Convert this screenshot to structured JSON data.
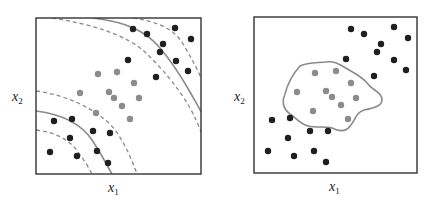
{
  "chart_data": [
    {
      "type": "scatter",
      "title": "",
      "xlabel": "x1",
      "ylabel": "x2",
      "grid": false,
      "legend": null,
      "description": "Two classes separated by a nonlinear (polynomial-like) decision boundary with two solid boundary curves and dashed margin curves",
      "series": [
        {
          "name": "class-dark",
          "color": "#1f1f1f",
          "points": [
            [
              133,
              29
            ],
            [
              147,
              34
            ],
            [
              175,
              28
            ],
            [
              191,
              39
            ],
            [
              163,
              44
            ],
            [
              160,
              52
            ],
            [
              128,
              60
            ],
            [
              176,
              61
            ],
            [
              188,
              71
            ],
            [
              156,
              77
            ],
            [
              54,
              121
            ],
            [
              72,
              119
            ],
            [
              93,
              131
            ],
            [
              110,
              133
            ],
            [
              70,
              138
            ],
            [
              50,
              152
            ],
            [
              77,
              156
            ],
            [
              97,
              151
            ],
            [
              108,
              163
            ]
          ]
        },
        {
          "name": "class-light",
          "color": "#8c8c8c",
          "points": [
            [
              98,
              74
            ],
            [
              117,
              72
            ],
            [
              134,
              83
            ],
            [
              80,
              93
            ],
            [
              109,
              92
            ],
            [
              114,
              98
            ],
            [
              139,
              98
            ],
            [
              122,
              106
            ],
            [
              96,
              113
            ],
            [
              130,
              119
            ]
          ]
        }
      ],
      "boundaries": {
        "solid": 2,
        "dashed": 4
      }
    },
    {
      "type": "scatter",
      "title": "",
      "xlabel": "x1",
      "ylabel": "x2",
      "grid": false,
      "legend": null,
      "description": "Same two classes separated by an irregular closed decision boundary enclosing the light class",
      "series": [
        {
          "name": "class-dark",
          "color": "#1f1f1f",
          "points": [
            [
              351,
              29
            ],
            [
              364,
              34
            ],
            [
              394,
              27
            ],
            [
              408,
              38
            ],
            [
              381,
              44
            ],
            [
              377,
              52
            ],
            [
              394,
              60
            ],
            [
              406,
              70
            ],
            [
              346,
              59
            ],
            [
              374,
              76
            ],
            [
              272,
              120
            ],
            [
              290,
              118
            ],
            [
              310,
              131
            ],
            [
              328,
              131
            ],
            [
              288,
              138
            ],
            [
              268,
              151
            ],
            [
              294,
              156
            ],
            [
              314,
              151
            ],
            [
              326,
              162
            ]
          ]
        },
        {
          "name": "class-light",
          "color": "#8c8c8c",
          "points": [
            [
              315,
              73
            ],
            [
              336,
              71
            ],
            [
              351,
              83
            ],
            [
              297,
              92
            ],
            [
              326,
              91
            ],
            [
              332,
              97
            ],
            [
              356,
              98
            ],
            [
              341,
              105
            ],
            [
              313,
              111
            ],
            [
              348,
              119
            ]
          ]
        }
      ],
      "boundaries": {
        "solid": 1,
        "dashed": 0
      }
    }
  ],
  "panels": [
    {
      "xlabel": "x",
      "xsub": "1",
      "ylabel": "x",
      "ysub": "2"
    },
    {
      "xlabel": "x",
      "xsub": "1",
      "ylabel": "x",
      "ysub": "2"
    }
  ],
  "colors": {
    "dark_point": "#1f1f1f",
    "light_point": "#8c8c8c",
    "boundary": "#8a8a8a",
    "frame": "#333333"
  }
}
